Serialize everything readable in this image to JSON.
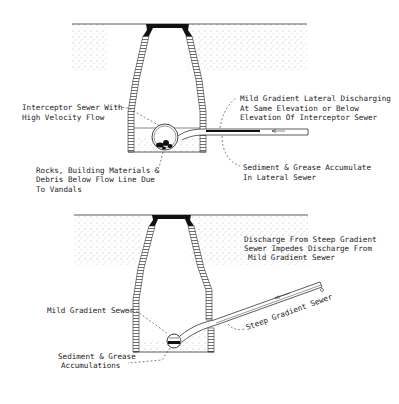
{
  "figure_1": {
    "labels": {
      "interceptor": [
        "Interceptor Sewer With",
        "High Velocity Flow"
      ],
      "lateral_discharge": [
        "Mild Gradient Lateral Discharging",
        "At Same Elevation or Below",
        "Elevation Of Interceptor Sewer"
      ],
      "rocks": [
        "Rocks, Building Materials &",
        "Debris Below Flow Line Due",
        "To Vandals"
      ],
      "sediment": [
        "Sediment & Grease Accumulate",
        "In Lateral Sewer"
      ]
    }
  },
  "figure_2": {
    "labels": {
      "discharge": [
        "Discharge From Steep Gradient",
        "Sewer Impedes Discharge From",
        "Mild Gradient Sewer"
      ],
      "mild_sewer": "Mild Gradient Sewer",
      "steep_sewer": "Steep Gradient Sewer",
      "sediment": [
        "Sediment & Grease",
        "Accumulations"
      ]
    }
  },
  "colors": {
    "ink": "#222222",
    "soil": "#bdbdbd",
    "background": "#ffffff"
  }
}
